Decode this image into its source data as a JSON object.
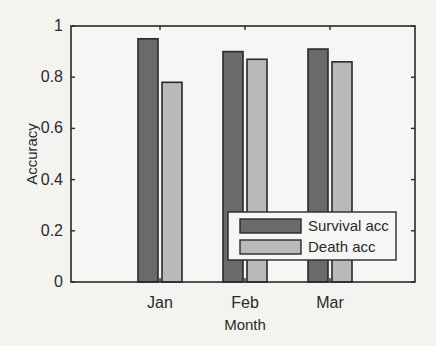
{
  "chart_data": {
    "type": "bar",
    "title": "",
    "xlabel": "Month",
    "ylabel": "Accuracy",
    "categories": [
      "Jan",
      "Feb",
      "Mar"
    ],
    "series": [
      {
        "name": "Survival acc",
        "values": [
          0.95,
          0.9,
          0.91
        ],
        "color": "#6a6a6a"
      },
      {
        "name": "Death acc",
        "values": [
          0.78,
          0.87,
          0.86
        ],
        "color": "#b9b9b9"
      }
    ],
    "ylim": [
      0,
      1
    ],
    "yticks": [
      0,
      0.2,
      0.4,
      0.6,
      0.8,
      1
    ],
    "ytick_labels": [
      "0",
      "0.2",
      "0.4",
      "0.6",
      "0.8",
      "1"
    ],
    "grid": false,
    "legend_position": "lower right",
    "edge_color": "#2a2a2a"
  }
}
